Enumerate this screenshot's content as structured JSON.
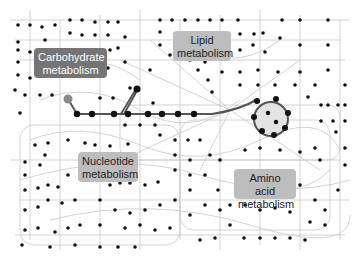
{
  "diagram": {
    "type": "metabolic-network-map",
    "colors": {
      "background": "#ffffff",
      "edge": "#c8c8c8",
      "node": "#111111",
      "highlight_edge": "#555555",
      "highlight_start_node": "#8a8a8a",
      "cycle_fill": "#e3e3e3",
      "label_dark_bg": "#757575",
      "label_light_bg": "#bdbdbd"
    },
    "labels": [
      {
        "id": "carbohydrate",
        "line1": "Carbohydrate",
        "line2": "metabolism",
        "style": "dark"
      },
      {
        "id": "lipid",
        "line1": "Lipid",
        "line2": "metabolism",
        "style": "light"
      },
      {
        "id": "nucleotide",
        "line1": "Nucleotide",
        "line2": "metabolism",
        "style": "light"
      },
      {
        "id": "amino-acid",
        "line1": "Amino acid",
        "line2": "metabolism",
        "style": "light"
      }
    ],
    "highlighted_pathway": {
      "description": "Pathway from carbohydrate metabolism to central cycle",
      "cycle": "circular pathway on right-center"
    }
  }
}
